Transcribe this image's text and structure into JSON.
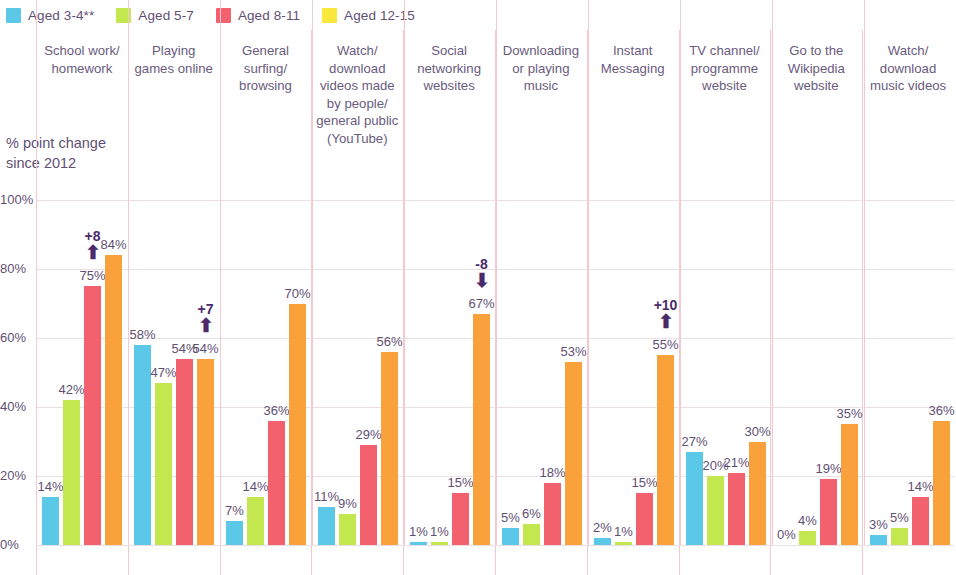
{
  "legend": {
    "items": [
      {
        "label": "Aged 3-4**",
        "color": "#5BC8E8"
      },
      {
        "label": "Aged 5-7",
        "color": "#C3E84F"
      },
      {
        "label": "Aged 8-11",
        "color": "#F4616E"
      },
      {
        "label": "Aged 12-15",
        "color": "#FAE93C"
      }
    ]
  },
  "axis": {
    "y_title": "% point change since 2012",
    "ticks": [
      "100%",
      "80%",
      "60%",
      "40%",
      "20%",
      "0%"
    ]
  },
  "chart_data": {
    "type": "bar",
    "title": "",
    "subtitle": "",
    "xlabel": "",
    "ylabel": "% point change since 2012",
    "ylim": [
      0,
      100
    ],
    "ytick_labels": [
      "0%",
      "20%",
      "40%",
      "60%",
      "80%",
      "100%"
    ],
    "ytick_values": [
      0,
      20,
      40,
      60,
      80,
      100
    ],
    "grid": true,
    "legend_position": "top-left",
    "categories": [
      "School work/ homework",
      "Playing games online",
      "General surfing/ browsing",
      "Watch/ download videos made by people/ general public (YouTube)",
      "Social networking websites",
      "Downloading or playing music",
      "Instant Messaging",
      "TV channel/ programme website",
      "Go to the Wikipedia website",
      "Watch/ download music videos"
    ],
    "series": [
      {
        "name": "Aged 3-4**",
        "color": "#5BC8E8",
        "values": [
          14,
          58,
          7,
          11,
          1,
          5,
          2,
          27,
          0,
          3
        ],
        "labels": [
          "14%",
          "58%",
          "7%",
          "11%",
          "1%",
          "5%",
          "2%",
          "27%",
          "0%",
          "3%"
        ]
      },
      {
        "name": "Aged 5-7",
        "color": "#C3E84F",
        "values": [
          42,
          47,
          14,
          9,
          1,
          6,
          1,
          20,
          4,
          5
        ],
        "labels": [
          "42%",
          "47%",
          "14%",
          "9%",
          "1%",
          "6%",
          "1%",
          "20%",
          "4%",
          "5%"
        ]
      },
      {
        "name": "Aged 8-11",
        "color": "#F4616E",
        "values": [
          75,
          54,
          36,
          29,
          15,
          18,
          15,
          21,
          19,
          14
        ],
        "labels": [
          "75%",
          "54%",
          "36%",
          "29%",
          "15%",
          "18%",
          "15%",
          "21%",
          "19%",
          "14%"
        ]
      },
      {
        "name": "Aged 12-15",
        "color": "#F9A23C",
        "values": [
          84,
          54,
          70,
          56,
          67,
          53,
          55,
          30,
          35,
          36
        ],
        "labels": [
          "84%",
          "54%",
          "70%",
          "56%",
          "67%",
          "53%",
          "55%",
          "30%",
          "35%",
          "36%"
        ]
      }
    ],
    "annotations": [
      {
        "group": 0,
        "series": 2,
        "text": "+8",
        "direction": "up"
      },
      {
        "group": 1,
        "series": 3,
        "text": "+7",
        "direction": "up"
      },
      {
        "group": 4,
        "series": 3,
        "text": "-8",
        "direction": "down"
      },
      {
        "group": 6,
        "series": 3,
        "text": "+10",
        "direction": "up"
      }
    ]
  },
  "colors": {
    "separator": "#F3C9CF",
    "gridline": "#EADFE3",
    "text": "#5F5073",
    "annotation": "#4A2A6B"
  }
}
